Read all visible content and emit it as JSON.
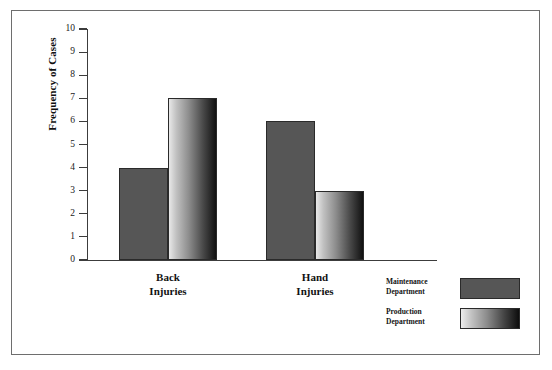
{
  "figure": {
    "has_border": true,
    "background_color": "#ffffff",
    "border_color": "#6e6e6e"
  },
  "chart_data": {
    "type": "bar",
    "title": "",
    "subtitle": "",
    "xlabel": "",
    "ylabel": "Frequency of Cases",
    "categories": [
      "Back Injuries",
      "Hand Injuries"
    ],
    "category_lines": [
      [
        "Back",
        "Injuries"
      ],
      [
        "Hand",
        "Injuries"
      ]
    ],
    "series": [
      {
        "name": "Maintenance Department",
        "name_lines": [
          "Maintenance",
          "Department"
        ],
        "values": [
          4,
          6
        ],
        "fill": "solid",
        "color": "#565656"
      },
      {
        "name": "Production Department",
        "name_lines": [
          "Production",
          "Department"
        ],
        "values": [
          7,
          3
        ],
        "fill": "gradient",
        "color_start": "#ededed",
        "color_end": "#0d0d0d"
      }
    ],
    "ylim": [
      0,
      10
    ],
    "ytick_values": [
      0,
      1,
      2,
      3,
      4,
      5,
      6,
      7,
      8,
      9,
      10
    ],
    "ytick_labels": [
      "0",
      "1",
      "2",
      "3",
      "4",
      "5",
      "6",
      "7",
      "8",
      "9",
      "10"
    ],
    "grid": false,
    "legend_position": "bottom-right",
    "bar_grouping": "grouped-touching"
  },
  "legend": {
    "entries": [
      {
        "label_lines": [
          "Maintenance",
          "Department"
        ],
        "swatch": "solid"
      },
      {
        "label_lines": [
          "Production",
          "Department"
        ],
        "swatch": "gradient"
      }
    ]
  }
}
